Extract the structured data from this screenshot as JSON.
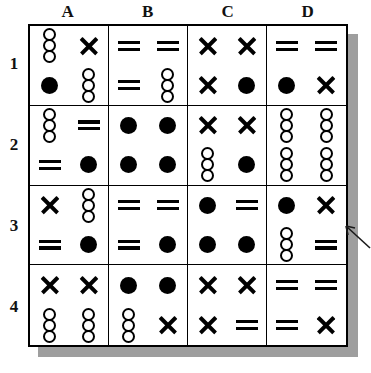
{
  "puzzle": {
    "title": "Symbol Matrix Grid Puzzle",
    "column_headers": [
      "A",
      "B",
      "C",
      "D"
    ],
    "row_headers": [
      "1",
      "2",
      "3",
      "4"
    ],
    "symbol_legend": {
      "circles3": "stack-of-three-open-circles",
      "filled": "filled-circle",
      "x": "x-mark",
      "equals": "equals-sign"
    },
    "colors": {
      "ink": "#000000",
      "background": "#ffffff",
      "shadow": "#9e9e9e"
    },
    "annotation": {
      "arrow": "left-pointing-arrow",
      "target_cell": "D3"
    },
    "cells": [
      {
        "id": "A1",
        "column": "A",
        "row": "1",
        "slots": [
          "circles3",
          "x",
          "filled",
          "circles3"
        ]
      },
      {
        "id": "B1",
        "column": "B",
        "row": "1",
        "slots": [
          "equals",
          "equals",
          "equals",
          "circles3"
        ]
      },
      {
        "id": "C1",
        "column": "C",
        "row": "1",
        "slots": [
          "x",
          "x",
          "x",
          "filled"
        ]
      },
      {
        "id": "D1",
        "column": "D",
        "row": "1",
        "slots": [
          "equals",
          "equals",
          "filled",
          "x"
        ]
      },
      {
        "id": "A2",
        "column": "A",
        "row": "2",
        "slots": [
          "circles3",
          "equals",
          "equals",
          "filled"
        ]
      },
      {
        "id": "B2",
        "column": "B",
        "row": "2",
        "slots": [
          "filled",
          "filled",
          "filled",
          "filled"
        ]
      },
      {
        "id": "C2",
        "column": "C",
        "row": "2",
        "slots": [
          "x",
          "x",
          "circles3",
          "filled"
        ]
      },
      {
        "id": "D2",
        "column": "D",
        "row": "2",
        "slots": [
          "circles3",
          "circles3",
          "circles3",
          "circles3"
        ]
      },
      {
        "id": "A3",
        "column": "A",
        "row": "3",
        "slots": [
          "x",
          "circles3",
          "equals",
          "filled"
        ]
      },
      {
        "id": "B3",
        "column": "B",
        "row": "3",
        "slots": [
          "equals",
          "equals",
          "equals",
          "filled"
        ]
      },
      {
        "id": "C3",
        "column": "C",
        "row": "3",
        "slots": [
          "filled",
          "equals",
          "filled",
          "filled"
        ]
      },
      {
        "id": "D3",
        "column": "D",
        "row": "3",
        "slots": [
          "filled",
          "x",
          "circles3",
          "equals"
        ]
      },
      {
        "id": "A4",
        "column": "A",
        "row": "4",
        "slots": [
          "x",
          "x",
          "circles3",
          "circles3"
        ]
      },
      {
        "id": "B4",
        "column": "B",
        "row": "4",
        "slots": [
          "filled",
          "filled",
          "circles3",
          "x"
        ]
      },
      {
        "id": "C4",
        "column": "C",
        "row": "4",
        "slots": [
          "x",
          "x",
          "x",
          "equals"
        ]
      },
      {
        "id": "D4",
        "column": "D",
        "row": "4",
        "slots": [
          "equals",
          "equals",
          "equals",
          "x"
        ]
      }
    ]
  }
}
